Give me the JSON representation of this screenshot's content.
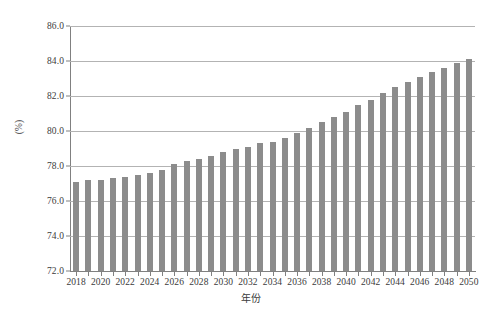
{
  "chart_data": {
    "type": "bar",
    "title": "",
    "subtitle": "",
    "xlabel": "年份",
    "ylabel": "(%)",
    "ylim": [
      72.0,
      86.0
    ],
    "ytick_step": 2.0,
    "ytick_labels": [
      "86.0",
      "84.0",
      "82.0",
      "80.0",
      "78.0",
      "76.0",
      "74.0",
      "72.0"
    ],
    "ytick_values": [
      86.0,
      84.0,
      82.0,
      80.0,
      78.0,
      76.0,
      74.0,
      72.0
    ],
    "grid": "horizontal",
    "legend": "none",
    "bar_color": "#8c8c8c",
    "xtick_labels": [
      "2018",
      "2020",
      "2022",
      "2024",
      "2026",
      "2028",
      "2030",
      "2032",
      "2034",
      "2036",
      "2038",
      "2040",
      "2042",
      "2044",
      "2046",
      "2048",
      "2050"
    ],
    "categories": [
      "2018",
      "2019",
      "2020",
      "2021",
      "2022",
      "2023",
      "2024",
      "2025",
      "2026",
      "2027",
      "2028",
      "2029",
      "2030",
      "2031",
      "2032",
      "2033",
      "2034",
      "2035",
      "2036",
      "2037",
      "2038",
      "2039",
      "2040",
      "2041",
      "2042",
      "2043",
      "2044",
      "2045",
      "2046",
      "2047",
      "2048",
      "2049",
      "2050"
    ],
    "values": [
      77.1,
      77.2,
      77.2,
      77.3,
      77.4,
      77.5,
      77.6,
      77.8,
      78.1,
      78.3,
      78.4,
      78.6,
      78.8,
      79.0,
      79.1,
      79.3,
      79.4,
      79.6,
      79.9,
      80.2,
      80.5,
      80.8,
      81.1,
      81.5,
      81.8,
      82.2,
      82.5,
      82.8,
      83.1,
      83.4,
      83.6,
      83.9,
      84.1
    ]
  }
}
